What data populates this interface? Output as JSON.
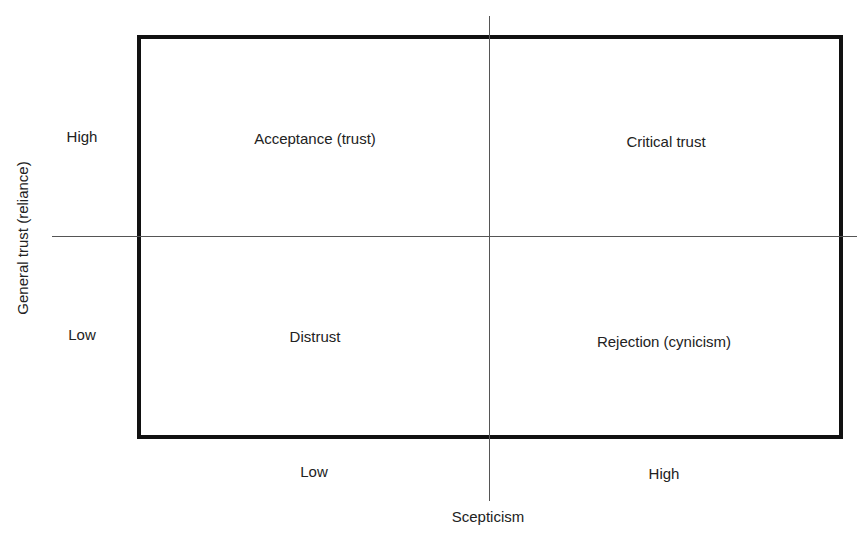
{
  "diagram": {
    "type": "2x2 matrix",
    "y_axis": {
      "label": "General trust (reliance)",
      "high": "High",
      "low": "Low"
    },
    "x_axis": {
      "label": "Scepticism",
      "low": "Low",
      "high": "High"
    },
    "quadrants": {
      "top_left": "Acceptance (trust)",
      "top_right": "Critical trust",
      "bottom_left": "Distrust",
      "bottom_right": "Rejection (cynicism)"
    }
  }
}
